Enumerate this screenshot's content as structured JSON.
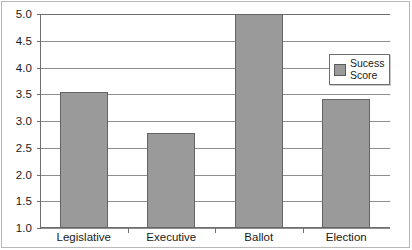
{
  "chart_data": {
    "type": "bar",
    "title": "",
    "subtitle": "",
    "xlabel": "",
    "ylabel": "",
    "categories": [
      "Legislative",
      "Executive",
      "Ballot",
      "Election"
    ],
    "values": [
      3.55,
      2.77,
      5.0,
      3.42
    ],
    "series": [
      {
        "name": "Sucess Score",
        "values": [
          3.55,
          2.77,
          5.0,
          3.42
        ]
      }
    ],
    "ylim": [
      1.0,
      5.0
    ],
    "ytick_labels": [
      "5.0",
      "4.5",
      "4.0",
      "3.5",
      "3.0",
      "2.5",
      "2.0",
      "1.5",
      "1.0"
    ],
    "ytick_values": [
      5.0,
      4.5,
      4.0,
      3.5,
      3.0,
      2.5,
      2.0,
      1.5,
      1.0
    ],
    "grid": true,
    "grid_axis": "y",
    "legend": {
      "position": "upper-right-inside",
      "entries": [
        {
          "label_line1": "Sucess",
          "label_line2": "Score",
          "color": "#9a9a9a"
        }
      ]
    },
    "colors": {
      "bar_fill": "#9a9a9a",
      "bar_border": "#646464",
      "gridline": "#8d8d8d",
      "axis": "#6e6e6e",
      "text": "#1a1a1a",
      "background": "#ffffff",
      "frame": "#b8b8b8"
    }
  }
}
